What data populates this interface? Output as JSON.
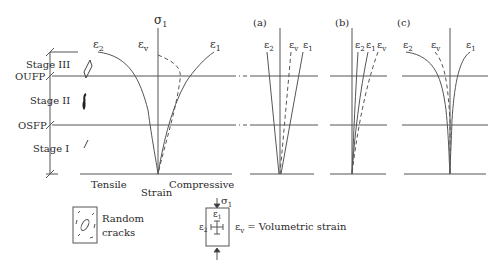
{
  "main_plot": {
    "axis_label": "σ",
    "axis_sub": "1",
    "curves": {
      "e2": {
        "sym": "ε",
        "sub": "2"
      },
      "ev": {
        "sym": "ε",
        "sub": "v"
      },
      "e1": {
        "sym": "ε",
        "sub": "1"
      }
    },
    "stages": [
      "Stage III",
      "Stage II",
      "Stage I"
    ],
    "thresholds": [
      "OUFP",
      "OSFP"
    ],
    "x_left": "Tensile",
    "x_center": "Strain",
    "x_right": "Compressive"
  },
  "panels": [
    {
      "label": "(a)",
      "curves": [
        {
          "sym": "ε",
          "sub": "2"
        },
        {
          "sym": "ε",
          "sub": "v"
        },
        {
          "sym": "ε",
          "sub": "1"
        }
      ]
    },
    {
      "label": "(b)",
      "curves": [
        {
          "sym": "ε",
          "sub": "2"
        },
        {
          "sym": "ε",
          "sub": "1"
        },
        {
          "sym": "ε",
          "sub": "v"
        }
      ]
    },
    {
      "label": "(c)",
      "curves": [
        {
          "sym": "ε",
          "sub": "2"
        },
        {
          "sym": "ε",
          "sub": "v"
        },
        {
          "sym": "ε",
          "sub": "1"
        }
      ]
    }
  ],
  "legend": {
    "cracks_line1": "Random",
    "cracks_line2": "cracks",
    "specimen_sigma": "σ",
    "specimen_sigma_sub": "1",
    "specimen_e1": "ε",
    "specimen_e1_sub": "1",
    "specimen_e2": "ε",
    "specimen_e2_sub": "2",
    "ev_sym": "ε",
    "ev_sub": "v",
    "ev_text": "= Volumetric strain"
  }
}
